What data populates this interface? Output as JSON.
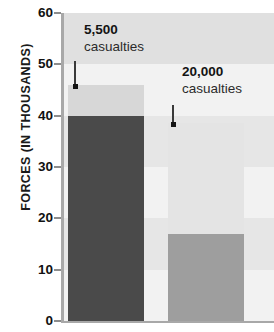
{
  "chart_data": {
    "type": "bar",
    "title": "",
    "xlabel": "",
    "ylabel": "FORCES (IN THOUSANDS)",
    "ylim": [
      0,
      60
    ],
    "ytick_labels": [
      "0",
      "10",
      "20",
      "30",
      "40",
      "50",
      "60"
    ],
    "ytick_values": [
      0,
      10,
      20,
      30,
      40,
      50,
      60
    ],
    "grid": false,
    "legend": "none",
    "categories": [
      "bar-left",
      "bar-right"
    ],
    "series": [
      {
        "name": "lower-segment",
        "values": [
          40,
          17
        ]
      },
      {
        "name": "upper-segment",
        "values": [
          6,
          21.5
        ]
      }
    ],
    "bars": [
      {
        "name": "bar-left",
        "total": 46,
        "lower_value": 40,
        "upper_value": 6,
        "lower_color": "#4a4a4a",
        "upper_color": "#d7d7d7"
      },
      {
        "name": "bar-right",
        "total": 38.5,
        "lower_value": 17,
        "upper_value": 21.5,
        "lower_color": "#9e9e9e",
        "upper_color": "#e4e4e4"
      }
    ],
    "annotations": [
      {
        "name": "annotation-left",
        "value": "5,500",
        "text": "casualties",
        "points_to_bar": "bar-left",
        "points_to_value": 46
      },
      {
        "name": "annotation-right",
        "value": "20,000",
        "text": "casualties",
        "points_to_bar": "bar-right",
        "points_to_value": 38.5
      }
    ],
    "background_bands": [
      {
        "from": 60,
        "to": 50,
        "color": "#e0e0e0"
      },
      {
        "from": 50,
        "to": 40,
        "color": "#f2f2f2"
      },
      {
        "from": 40,
        "to": 30,
        "color": "#e6e6e6"
      },
      {
        "from": 30,
        "to": 20,
        "color": "#f2f2f2"
      },
      {
        "from": 20,
        "to": 10,
        "color": "#e6e6e6"
      },
      {
        "from": 10,
        "to": 0,
        "color": "#f2f2f2"
      }
    ],
    "colors": {
      "axis": "#a8a8a8",
      "text": "#141414",
      "leader": "#3a3a3a"
    }
  }
}
